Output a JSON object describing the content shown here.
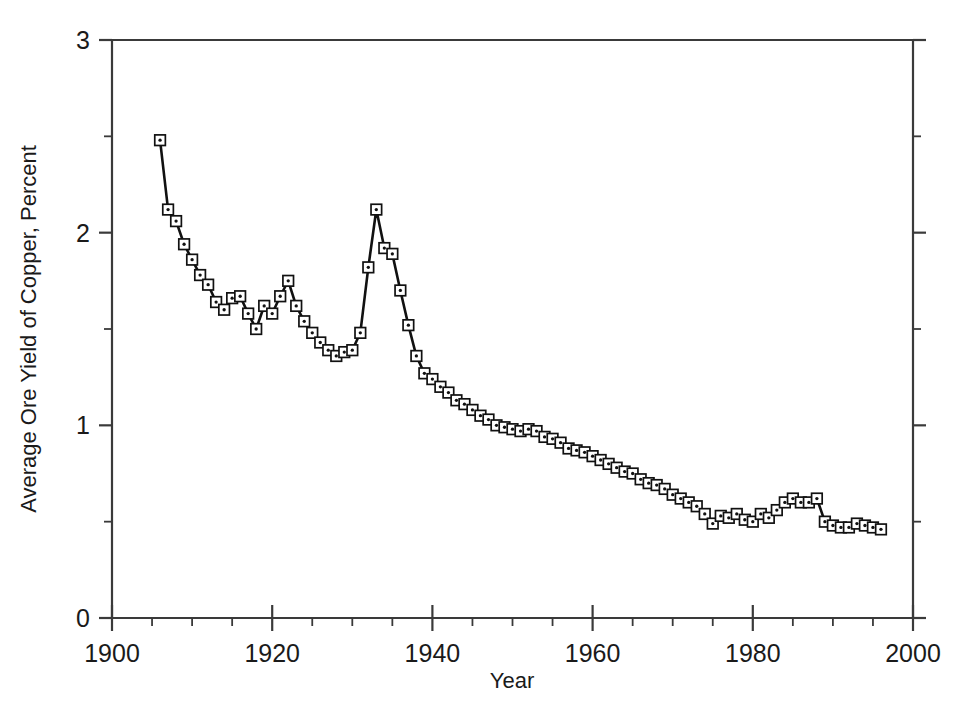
{
  "chart_data": {
    "type": "line",
    "title": "",
    "xlabel": "Year",
    "ylabel": "Average Ore Yield of Copper, Percent",
    "xlim": [
      1900,
      2000
    ],
    "ylim": [
      0,
      3
    ],
    "x_ticks_major": [
      1900,
      1920,
      1940,
      1960,
      1980,
      2000
    ],
    "x_ticks_minor_step": 5,
    "y_ticks_major": [
      0,
      1,
      2,
      3
    ],
    "y_ticks_minor": [
      0.5,
      1.5,
      2.5
    ],
    "grid": false,
    "legend": "none",
    "marker": "open-square-with-center-dot",
    "line_color": "#111111",
    "marker_fill": "#ffffff",
    "marker_edge": "#111111",
    "series": [
      {
        "name": "Average ore yield of copper",
        "x": [
          1906,
          1907,
          1908,
          1909,
          1910,
          1911,
          1912,
          1913,
          1914,
          1915,
          1916,
          1917,
          1918,
          1919,
          1920,
          1921,
          1922,
          1923,
          1924,
          1925,
          1926,
          1927,
          1928,
          1929,
          1930,
          1931,
          1932,
          1933,
          1934,
          1935,
          1936,
          1937,
          1938,
          1939,
          1940,
          1941,
          1942,
          1943,
          1944,
          1945,
          1946,
          1947,
          1948,
          1949,
          1950,
          1951,
          1952,
          1953,
          1954,
          1955,
          1956,
          1957,
          1958,
          1959,
          1960,
          1961,
          1962,
          1963,
          1964,
          1965,
          1966,
          1967,
          1968,
          1969,
          1970,
          1971,
          1972,
          1973,
          1974,
          1975,
          1976,
          1977,
          1978,
          1979,
          1980,
          1981,
          1982,
          1983,
          1984,
          1985,
          1986,
          1987,
          1988,
          1989,
          1990,
          1991,
          1992,
          1993,
          1994,
          1995,
          1996
        ],
        "y": [
          2.48,
          2.12,
          2.06,
          1.94,
          1.86,
          1.78,
          1.73,
          1.64,
          1.6,
          1.66,
          1.67,
          1.58,
          1.5,
          1.62,
          1.58,
          1.67,
          1.75,
          1.62,
          1.54,
          1.48,
          1.43,
          1.39,
          1.36,
          1.38,
          1.39,
          1.48,
          1.82,
          2.12,
          1.92,
          1.89,
          1.7,
          1.52,
          1.36,
          1.27,
          1.24,
          1.2,
          1.17,
          1.13,
          1.11,
          1.08,
          1.05,
          1.03,
          1.0,
          0.99,
          0.98,
          0.97,
          0.98,
          0.97,
          0.94,
          0.93,
          0.91,
          0.88,
          0.87,
          0.86,
          0.84,
          0.82,
          0.8,
          0.78,
          0.76,
          0.75,
          0.72,
          0.7,
          0.69,
          0.67,
          0.64,
          0.62,
          0.6,
          0.58,
          0.54,
          0.49,
          0.53,
          0.52,
          0.54,
          0.51,
          0.5,
          0.54,
          0.52,
          0.56,
          0.6,
          0.62,
          0.6,
          0.6,
          0.62,
          0.5,
          0.48,
          0.47,
          0.47,
          0.49,
          0.48,
          0.47,
          0.46
        ]
      }
    ]
  },
  "axes": {
    "x_tick_labels": [
      "1900",
      "1920",
      "1940",
      "1960",
      "1980",
      "2000"
    ],
    "y_tick_labels": [
      "0",
      "1",
      "2",
      "3"
    ],
    "x_axis_title": "Year",
    "y_axis_title": "Average Ore Yield of Copper, Percent"
  }
}
